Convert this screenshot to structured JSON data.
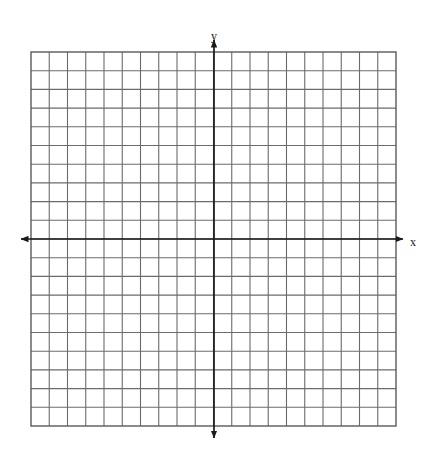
{
  "figure": {
    "type": "blank-coordinate-grid",
    "background_color": "#ffffff"
  },
  "chart_data": {
    "type": "scatter",
    "title": "",
    "subtitle": "",
    "xlabel": "x",
    "ylabel": "y",
    "x": [],
    "values": [],
    "series": [],
    "annotations": [],
    "legend": [],
    "legend_position": "none",
    "grid": true,
    "xlim": [
      -10,
      10
    ],
    "ylim": [
      -10,
      10
    ],
    "x_tick_labels": [],
    "y_tick_labels": [],
    "grid_columns": 20,
    "grid_rows": 20,
    "grid_cell_px": 18.2,
    "x_axis_row_index": 10,
    "y_axis_col_index": 10
  },
  "grid": {
    "left_px": 31,
    "top_px": 52,
    "right_px": 396,
    "bottom_px": 426,
    "columns": 20,
    "rows": 20,
    "line_color": "#6b6b6b",
    "border_color": "#5a5a5a",
    "cell_fill": "#ffffff"
  },
  "axes": {
    "color": "#1a1a1a",
    "x_axis": {
      "label": "x",
      "label_x_px": 410,
      "label_y_px": 243,
      "y_px": 239,
      "start_px": 21,
      "end_px": 403,
      "arrow_start": true,
      "arrow_end": true
    },
    "y_axis": {
      "label": "y",
      "label_x_px": 214,
      "label_y_px": 37,
      "x_px": 214,
      "start_px": 40,
      "end_px": 438,
      "arrow_start": true,
      "arrow_end": true
    }
  }
}
